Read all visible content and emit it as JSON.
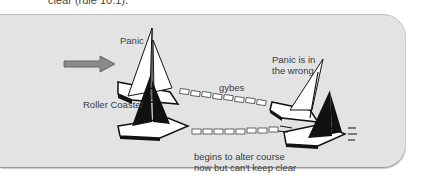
{
  "header": {
    "text": "clear (rule 10.1)."
  },
  "diagram": {
    "labels": {
      "panic": "Panic",
      "roller_coaster": "Roller Coaster",
      "gybes": "gybes",
      "panic_wrong_line1": "Panic is in",
      "panic_wrong_line2": "the wrong",
      "alter_line1": "begins to alter course",
      "alter_line2": "now but can't keep clear"
    },
    "icons": [
      "wind-arrow-icon",
      "sailboat-white-icon",
      "sailboat-black-icon"
    ],
    "colors": {
      "panel_bg": "#e3e3e3",
      "arrow": "#8a8a8a",
      "sail_black": "#111111",
      "hull_white": "#ffffff"
    }
  }
}
